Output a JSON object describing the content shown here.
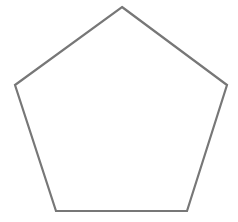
{
  "diagram": {
    "shape": "pentagon",
    "fill": "#ffffff",
    "stroke": "#777777",
    "stroke_width": 2.2,
    "points": "122,7 227,85 187,211 56,211 15,85"
  }
}
